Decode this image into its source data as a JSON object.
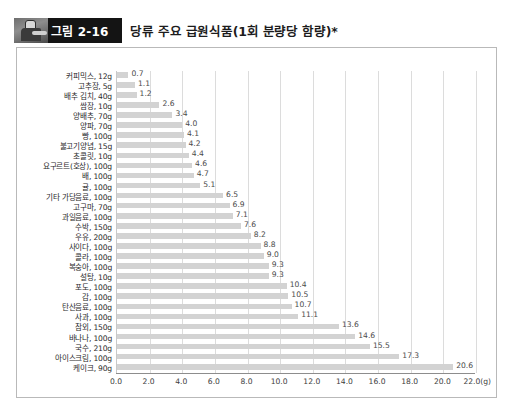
{
  "header": {
    "badge_label": "그림 2-16",
    "badge_icon": "chef-figure-icon",
    "title": "당류 주요 급원식품(1회 분량당 함량)*"
  },
  "chart_data": {
    "type": "bar",
    "orientation": "horizontal",
    "title": "당류 주요 급원식품(1회 분량당 함량)*",
    "xlabel": "22.0(g)",
    "ylabel": "",
    "xlim": [
      0.0,
      22.0
    ],
    "grid": true,
    "legend": "none",
    "bar_color": "#d3d3d3",
    "xticks": [
      "0.0",
      "2.0",
      "4.0",
      "6.0",
      "8.0",
      "10.0",
      "12.0",
      "14.0",
      "16.0",
      "18.0",
      "20.0",
      "22.0(g)"
    ],
    "xtick_values": [
      0,
      2,
      4,
      6,
      8,
      10,
      12,
      14,
      16,
      18,
      20,
      22
    ],
    "categories": [
      "커피믹스, 12g",
      "고추장, 5g",
      "배추 김치, 40g",
      "쌈장, 10g",
      "양배추, 70g",
      "양파, 70g",
      "빵, 100g",
      "불고기양념, 15g",
      "초콜릿, 10g",
      "요구르트(호상), 100g",
      "배, 100g",
      "귤, 100g",
      "기타 가당음료, 100g",
      "고구마, 70g",
      "과일음료, 100g",
      "수박, 150g",
      "우유, 200g",
      "사이다, 100g",
      "콜라, 100g",
      "복숭아, 100g",
      "설탕, 10g",
      "포도, 100g",
      "감, 100g",
      "탄산음료, 100g",
      "사과, 100g",
      "참외, 150g",
      "바나나, 100g",
      "국수, 210g",
      "아이스크림, 100g",
      "케이크, 90g"
    ],
    "values": [
      0.7,
      1.1,
      1.2,
      2.6,
      3.4,
      4.0,
      4.1,
      4.2,
      4.4,
      4.6,
      4.7,
      5.1,
      6.5,
      6.9,
      7.1,
      7.6,
      8.2,
      8.8,
      9.0,
      9.3,
      9.3,
      10.4,
      10.5,
      10.7,
      11.1,
      13.6,
      14.6,
      15.5,
      17.3,
      20.6
    ],
    "value_labels": [
      "0.7",
      "1.1",
      "1.2",
      "2.6",
      "3.4",
      "4.0",
      "4.1",
      "4.2",
      "4.4",
      "4.6",
      "4.7",
      "5.1",
      "6.5",
      "6.9",
      "7.1",
      "7.6",
      "8.2",
      "8.8",
      "9.0",
      "9.3",
      "9.3",
      "10.4",
      "10.5",
      "10.7",
      "11.1",
      "13.6",
      "14.6",
      "15.5",
      "17.3",
      "20.6"
    ]
  }
}
